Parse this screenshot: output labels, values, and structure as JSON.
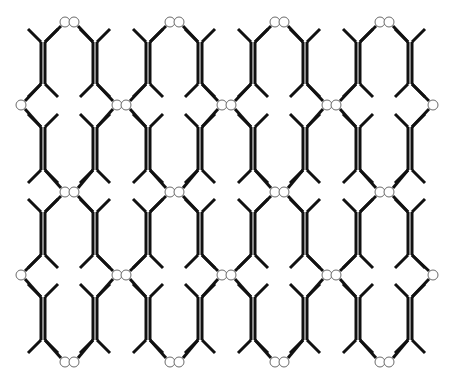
{
  "diagram": {
    "title": "",
    "colors": {
      "background": "#ffffff",
      "bond": "#111111",
      "node_fill": "#ffffff",
      "node_stroke": "#6b6b6b"
    },
    "grid": {
      "columns": 4,
      "period_x": 105,
      "period_y": 170,
      "bar_x_pairs": [
        [
          43,
          95
        ],
        [
          148,
          200
        ],
        [
          253,
          305
        ],
        [
          358,
          410
        ]
      ],
      "bar_bands_y": [
        [
          42,
          84
        ],
        [
          127,
          170
        ],
        [
          212,
          255
        ],
        [
          297,
          340
        ]
      ],
      "double_bar_gap": 4
    },
    "nodes": {
      "column_pair_rows_y": [
        22,
        192,
        362
      ],
      "junction_pair_rows_y": [
        105,
        275
      ],
      "pair_offset": 9,
      "radius": 5,
      "edge_singles": [
        [
          21,
          105
        ],
        [
          21,
          275
        ],
        [
          433,
          105
        ],
        [
          433,
          275
        ]
      ]
    },
    "caption": ""
  }
}
